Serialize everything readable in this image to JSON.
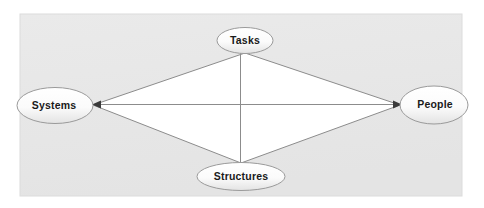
{
  "canvas": {
    "width": 484,
    "height": 208,
    "outer_background": "#ffffff"
  },
  "panel": {
    "x": 20,
    "y": 14,
    "width": 442,
    "height": 182,
    "fill": "#e8e8e8",
    "border_color": "#dcdcdc"
  },
  "diagram": {
    "title": "",
    "type": "relationship-diamond",
    "diamond": {
      "fill": "#ffffff",
      "stroke": "#8c8c8c",
      "stroke_width": 1
    },
    "connector": {
      "stroke": "#8c8c8c",
      "stroke_width": 1,
      "arrow_color": "#3a3a3a"
    },
    "node_style": {
      "stroke": "#9a9a9a",
      "fill_top": "#ffffff",
      "fill_bottom": "#e4e4e4",
      "text_color": "#1a1a1a"
    },
    "nodes": [
      {
        "id": "tasks",
        "label": "Tasks",
        "cx": 245,
        "cy": 40.5,
        "rx": 28,
        "ry": 13,
        "position": "top"
      },
      {
        "id": "systems",
        "label": "Systems",
        "cx": 55,
        "cy": 105.5,
        "rx": 38,
        "ry": 18,
        "position": "left"
      },
      {
        "id": "people",
        "label": "People",
        "cx": 434,
        "cy": 105,
        "rx": 34,
        "ry": 19,
        "position": "right"
      },
      {
        "id": "structures",
        "label": "Structures",
        "cx": 241,
        "cy": 176.5,
        "rx": 44,
        "ry": 14,
        "position": "bottom"
      }
    ],
    "edges": [
      {
        "id": "tasks-systems",
        "from": "tasks",
        "to": "systems"
      },
      {
        "id": "tasks-people",
        "from": "tasks",
        "to": "people"
      },
      {
        "id": "structures-systems",
        "from": "structures",
        "to": "systems"
      },
      {
        "id": "structures-people",
        "from": "structures",
        "to": "people"
      },
      {
        "id": "systems-people",
        "from": "systems",
        "to": "people",
        "style": "horizontal-axis",
        "arrows": "both"
      },
      {
        "id": "tasks-structures",
        "from": "tasks",
        "to": "structures",
        "style": "vertical-axis",
        "arrows": "none"
      }
    ],
    "center": {
      "x": 240,
      "y": 104
    }
  }
}
